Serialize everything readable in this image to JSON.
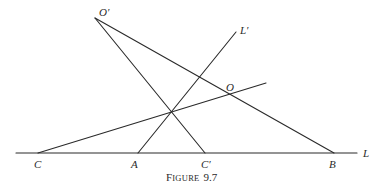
{
  "figure": {
    "caption_prefix_cap": "F",
    "caption_prefix_rest": "IGURE",
    "caption_number": "9.7",
    "caption_full": "FIGURE 9.7"
  },
  "points": {
    "O_prime": {
      "label": "O′",
      "x": 95,
      "y": 18
    },
    "L_prime": {
      "label": "L′",
      "x": 236,
      "y": 32
    },
    "O": {
      "label": "O",
      "x": 226,
      "y": 89
    },
    "C": {
      "label": "C",
      "x": 38,
      "y": 153
    },
    "A": {
      "label": "A",
      "x": 138,
      "y": 153
    },
    "C_prime": {
      "label": "C′",
      "x": 205,
      "y": 153
    },
    "B": {
      "label": "B",
      "x": 334,
      "y": 153
    },
    "L": {
      "label": "L"
    },
    "X": {
      "label": "",
      "x": 172,
      "y": 111
    }
  },
  "lines": [
    {
      "name": "line-L",
      "from": [
        16,
        153
      ],
      "to": [
        357,
        153
      ]
    },
    {
      "name": "line-O-prime-B",
      "from": [
        95,
        18
      ],
      "to": [
        334,
        153
      ]
    },
    {
      "name": "line-O-prime-C-prime",
      "from": [
        95,
        18
      ],
      "to": [
        205,
        153
      ]
    },
    {
      "name": "line-A-L-prime",
      "from": [
        138,
        153
      ],
      "to": [
        236,
        32
      ]
    },
    {
      "name": "line-C-O-extended",
      "from": [
        38,
        153
      ],
      "to": [
        266,
        83
      ]
    }
  ],
  "colors": {
    "ink": "#2a2a2a",
    "background": "#ffffff"
  }
}
